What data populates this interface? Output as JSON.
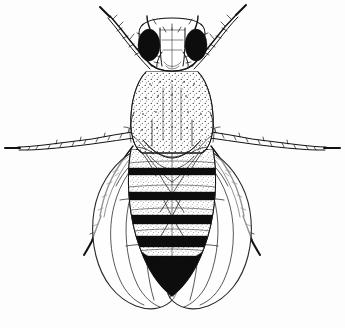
{
  "figure": {
    "kind": "scientific-line-drawing",
    "style": "black ink stipple and line engraving on white background",
    "background_color": "#fdfdfd",
    "ink_color": "#111111",
    "width_px": 345,
    "height_px": 328,
    "caption": "",
    "parts": [
      {
        "name": "head",
        "label": "head"
      },
      {
        "name": "compound-eye-left",
        "label": "left compound eye"
      },
      {
        "name": "compound-eye-right",
        "label": "right compound eye"
      },
      {
        "name": "antenna-left",
        "label": "left antenna"
      },
      {
        "name": "antenna-right",
        "label": "right antenna"
      },
      {
        "name": "thorax",
        "label": "thorax (stippled scutum)"
      },
      {
        "name": "scutellum",
        "label": "scutellum"
      },
      {
        "name": "abdomen",
        "label": "banded abdomen"
      },
      {
        "name": "wing-left",
        "label": "left wing"
      },
      {
        "name": "wing-right",
        "label": "right wing"
      },
      {
        "name": "foreleg-left",
        "label": "left foreleg"
      },
      {
        "name": "foreleg-right",
        "label": "right foreleg"
      },
      {
        "name": "midleg-left",
        "label": "left midleg"
      },
      {
        "name": "midleg-right",
        "label": "right midleg"
      },
      {
        "name": "hindleg-left",
        "label": "left hindleg"
      },
      {
        "name": "hindleg-right",
        "label": "right hindleg"
      }
    ],
    "abdomen_bands": [
      {
        "index": 1,
        "y": 172,
        "thickness": 7,
        "color": "#0d0d0d"
      },
      {
        "index": 2,
        "y": 196,
        "thickness": 8,
        "color": "#0d0d0d"
      },
      {
        "index": 3,
        "y": 219,
        "thickness": 9,
        "color": "#0d0d0d"
      },
      {
        "index": 4,
        "y": 241,
        "thickness": 11,
        "color": "#0d0d0d"
      },
      {
        "index": 5,
        "y": 262,
        "thickness": 12,
        "color": "#0d0d0d"
      }
    ],
    "colors": {
      "ink": "#111111",
      "solid_black": "#0d0d0d",
      "paper": "#fdfdfd",
      "wing_membrane": "#ffffff"
    }
  }
}
